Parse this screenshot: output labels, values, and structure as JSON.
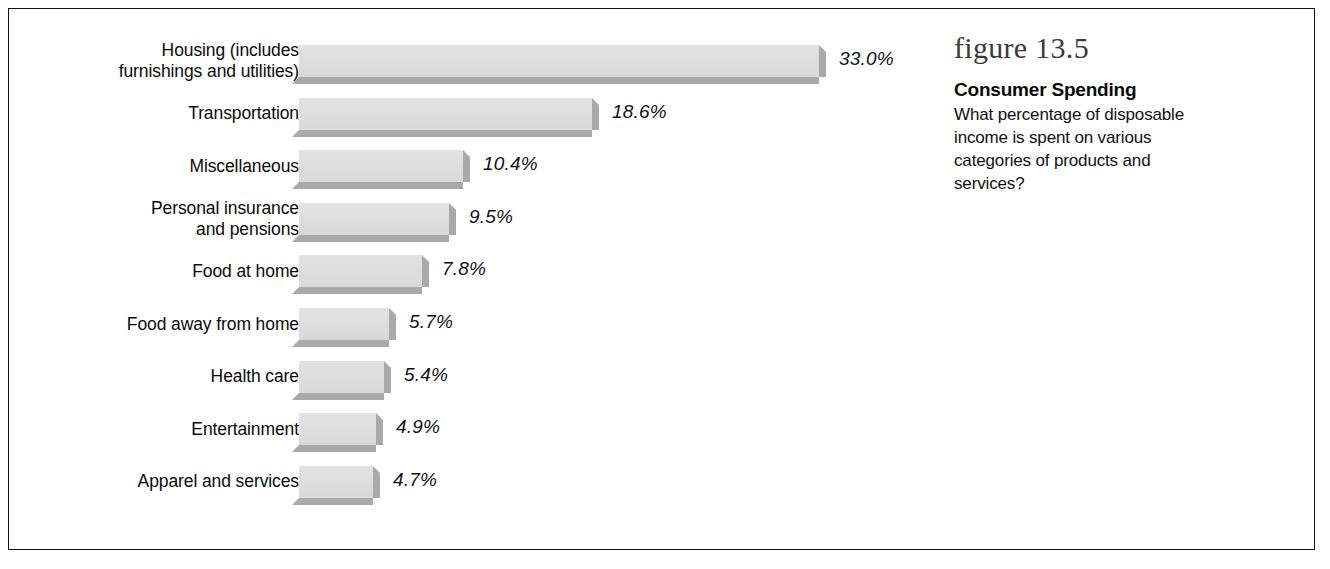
{
  "figure": {
    "number_label": "figure 13.5",
    "title": "Consumer Spending",
    "description": "What percentage of disposable income is spent on various categories of products and services?"
  },
  "colors": {
    "bar_face": "#dedede",
    "bar_shadow": "#a9a9a9",
    "text": "#0a0a0a",
    "frame": "#121212",
    "background": "#ffffff"
  },
  "chart_data": {
    "type": "bar",
    "orientation": "horizontal",
    "title": "Consumer Spending",
    "subtitle": "What percentage of disposable income is spent on various categories of products and services?",
    "xlabel": "",
    "ylabel": "",
    "xlim": [
      0,
      35
    ],
    "grid": false,
    "legend": false,
    "value_suffix": "%",
    "categories": [
      "Housing (includes\nfurnishings and utilities)",
      "Transportation",
      "Miscellaneous",
      "Personal insurance\nand pensions",
      "Food at home",
      "Food away from home",
      "Health care",
      "Entertainment",
      "Apparel and services"
    ],
    "values": [
      33.0,
      18.6,
      10.4,
      9.5,
      7.8,
      5.7,
      5.4,
      4.9,
      4.7
    ],
    "value_labels": [
      "33.0%",
      "18.6%",
      "10.4%",
      "9.5%",
      "7.8%",
      "5.7%",
      "5.4%",
      "4.9%",
      "4.7%"
    ]
  },
  "bars": [
    {
      "label": "Housing (includes\nfurnishings and utilities)",
      "value": 33.0,
      "value_label": "33.0%"
    },
    {
      "label": "Transportation",
      "value": 18.6,
      "value_label": "18.6%"
    },
    {
      "label": "Miscellaneous",
      "value": 10.4,
      "value_label": "10.4%"
    },
    {
      "label": "Personal insurance\nand pensions",
      "value": 9.5,
      "value_label": "9.5%"
    },
    {
      "label": "Food at home",
      "value": 7.8,
      "value_label": "7.8%"
    },
    {
      "label": "Food away from home",
      "value": 5.7,
      "value_label": "5.7%"
    },
    {
      "label": "Health care",
      "value": 5.4,
      "value_label": "5.4%"
    },
    {
      "label": "Entertainment",
      "value": 4.9,
      "value_label": "4.9%"
    },
    {
      "label": "Apparel and services",
      "value": 4.7,
      "value_label": "4.7%"
    }
  ]
}
